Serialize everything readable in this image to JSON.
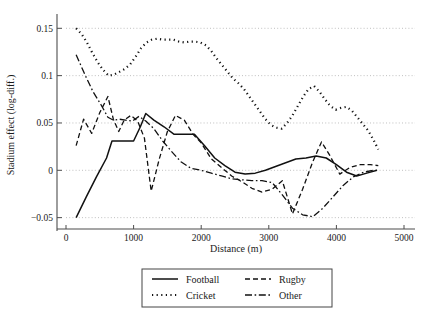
{
  "chart_data": {
    "type": "line",
    "title": "",
    "xlabel": "Distance (m)",
    "ylabel": "Stadium effect (log-diff.)",
    "xlim": [
      0,
      5000
    ],
    "ylim": [
      -0.062,
      0.163
    ],
    "grid": true,
    "legend_position": "bottom-center",
    "xticks": [
      0,
      1000,
      2000,
      3000,
      4000,
      5000
    ],
    "xtick_labels": [
      "0",
      "1000",
      "2000",
      "3000",
      "4000",
      "5000"
    ],
    "yticks": [
      -0.05,
      0,
      0.05,
      0.1,
      0.15
    ],
    "ytick_labels": [
      "−0.05",
      "0",
      "0.05",
      "0.1",
      "0.15"
    ],
    "series": [
      {
        "name": "Football",
        "style": "solid",
        "dash": "none",
        "color": "#111111",
        "width": 1.5,
        "x": [
          150,
          300,
          450,
          600,
          680,
          760,
          900,
          1000,
          1100,
          1180,
          1300,
          1450,
          1600,
          1750,
          1900,
          2050,
          2200,
          2350,
          2500,
          2650,
          2800,
          2950,
          3100,
          3250,
          3400,
          3550,
          3700,
          3850,
          4000,
          4150,
          4300,
          4450,
          4600
        ],
        "y": [
          -0.05,
          -0.028,
          -0.007,
          0.013,
          0.031,
          0.031,
          0.031,
          0.031,
          0.046,
          0.06,
          0.053,
          0.046,
          0.038,
          0.038,
          0.038,
          0.026,
          0.013,
          0.005,
          -0.002,
          -0.004,
          -0.003,
          0.0,
          0.004,
          0.008,
          0.012,
          0.013,
          0.015,
          0.013,
          0.006,
          -0.002,
          -0.006,
          -0.003,
          0.0
        ]
      },
      {
        "name": "Rugby",
        "style": "dashed",
        "dash": "5 3",
        "color": "#111111",
        "width": 1.3,
        "x": [
          150,
          260,
          380,
          500,
          620,
          700,
          780,
          860,
          960,
          1060,
          1160,
          1260,
          1380,
          1500,
          1620,
          1750,
          1880,
          2000,
          2150,
          2300,
          2450,
          2600,
          2750,
          2900,
          3050,
          3200,
          3350,
          3500,
          3650,
          3780,
          3900,
          4050,
          4200,
          4350,
          4500,
          4620
        ],
        "y": [
          0.026,
          0.054,
          0.039,
          0.061,
          0.078,
          0.054,
          0.041,
          0.053,
          0.058,
          0.052,
          0.034,
          -0.022,
          0.012,
          0.041,
          0.058,
          0.053,
          0.038,
          0.029,
          0.012,
          0.003,
          -0.006,
          -0.012,
          -0.019,
          -0.023,
          -0.02,
          -0.011,
          -0.046,
          -0.02,
          0.009,
          0.03,
          0.016,
          -0.004,
          0.003,
          0.006,
          0.006,
          0.005
        ]
      },
      {
        "name": "Cricket",
        "style": "dotted",
        "dash": "1.2 3.4",
        "color": "#111111",
        "width": 2.2,
        "x": [
          150,
          230,
          310,
          390,
          470,
          550,
          630,
          710,
          790,
          870,
          950,
          1030,
          1110,
          1190,
          1270,
          1350,
          1430,
          1510,
          1590,
          1670,
          1750,
          1830,
          1910,
          1990,
          2070,
          2150,
          2230,
          2310,
          2390,
          2470,
          2550,
          2630,
          2710,
          2790,
          2870,
          2950,
          3030,
          3110,
          3190,
          3270,
          3350,
          3430,
          3510,
          3590,
          3670,
          3750,
          3830,
          3910,
          3990,
          4070,
          4150,
          4230,
          4310,
          4390,
          4470,
          4550,
          4620
        ],
        "y": [
          0.15,
          0.144,
          0.135,
          0.124,
          0.114,
          0.106,
          0.1,
          0.101,
          0.104,
          0.107,
          0.112,
          0.12,
          0.129,
          0.135,
          0.138,
          0.139,
          0.138,
          0.138,
          0.138,
          0.136,
          0.135,
          0.136,
          0.136,
          0.135,
          0.132,
          0.126,
          0.118,
          0.111,
          0.104,
          0.097,
          0.092,
          0.086,
          0.078,
          0.07,
          0.062,
          0.054,
          0.048,
          0.045,
          0.044,
          0.05,
          0.058,
          0.068,
          0.078,
          0.086,
          0.089,
          0.083,
          0.075,
          0.068,
          0.064,
          0.066,
          0.067,
          0.063,
          0.056,
          0.049,
          0.042,
          0.032,
          0.022
        ]
      },
      {
        "name": "Other",
        "style": "dashdot",
        "dash": "7 2.6 1.6 2.6",
        "color": "#111111",
        "width": 1.3,
        "x": [
          150,
          280,
          400,
          520,
          620,
          700,
          790,
          880,
          980,
          1080,
          1180,
          1300,
          1430,
          1560,
          1700,
          1850,
          2000,
          2150,
          2300,
          2450,
          2600,
          2750,
          2900,
          3050,
          3200,
          3350,
          3500,
          3650,
          3800,
          3950,
          4100,
          4250,
          4400,
          4550,
          4620
        ],
        "y": [
          0.122,
          0.101,
          0.083,
          0.069,
          0.056,
          0.053,
          0.054,
          0.053,
          0.052,
          0.057,
          0.052,
          0.044,
          0.031,
          0.02,
          0.009,
          0.002,
          0.0,
          -0.003,
          -0.006,
          -0.009,
          -0.01,
          -0.011,
          -0.011,
          -0.013,
          -0.026,
          -0.04,
          -0.047,
          -0.049,
          -0.04,
          -0.028,
          -0.016,
          -0.007,
          -0.002,
          0.0,
          0.0
        ]
      }
    ]
  },
  "legend": {
    "entries": [
      {
        "label": "Football",
        "style": "solid"
      },
      {
        "label": "Rugby",
        "style": "dashed"
      },
      {
        "label": "Cricket",
        "style": "dotted"
      },
      {
        "label": "Other",
        "style": "dashdot"
      }
    ]
  }
}
